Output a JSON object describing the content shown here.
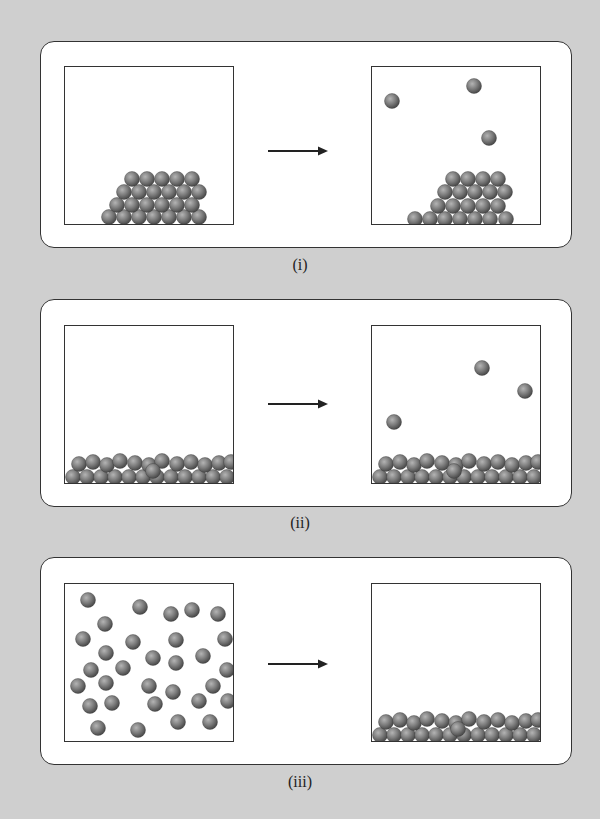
{
  "figure": {
    "ball_color": {
      "highlight": "#b4b4b4",
      "mid": "#7c7c7c",
      "edge": "#4a4a4a"
    },
    "background": "#cfcfcf",
    "ball_radius": 7.5,
    "panels": [
      {
        "label": "(i)",
        "description": "solid pile -> solid pile with 3 particles escaped into gas",
        "before": {
          "balls": [
            [
              44,
              150
            ],
            [
              59,
              150
            ],
            [
              74,
              150
            ],
            [
              89,
              150
            ],
            [
              104,
              150
            ],
            [
              119,
              150
            ],
            [
              134,
              150
            ],
            [
              52,
              138
            ],
            [
              67,
              138
            ],
            [
              82,
              138
            ],
            [
              97,
              138
            ],
            [
              112,
              138
            ],
            [
              127,
              138
            ],
            [
              59,
              125
            ],
            [
              74,
              125
            ],
            [
              89,
              125
            ],
            [
              104,
              125
            ],
            [
              119,
              125
            ],
            [
              134,
              125
            ],
            [
              67,
              112
            ],
            [
              82,
              112
            ],
            [
              97,
              112
            ],
            [
              112,
              112
            ],
            [
              127,
              112
            ]
          ]
        },
        "after": {
          "balls": [
            [
              43,
              152
            ],
            [
              58,
              152
            ],
            [
              73,
              152
            ],
            [
              88,
              152
            ],
            [
              103,
              152
            ],
            [
              118,
              152
            ],
            [
              134,
              152
            ],
            [
              66,
              139
            ],
            [
              81,
              139
            ],
            [
              96,
              139
            ],
            [
              111,
              139
            ],
            [
              126,
              139
            ],
            [
              73,
              125
            ],
            [
              88,
              125
            ],
            [
              103,
              125
            ],
            [
              118,
              125
            ],
            [
              133,
              125
            ],
            [
              81,
              112
            ],
            [
              96,
              112
            ],
            [
              111,
              112
            ],
            [
              126,
              112
            ],
            [
              20,
              34
            ],
            [
              102,
              19
            ],
            [
              117,
              71
            ]
          ]
        }
      },
      {
        "label": "(ii)",
        "description": "liquid layer -> liquid layer with 3 particles evaporated",
        "before": {
          "balls": [
            [
              8,
              151
            ],
            [
              22,
              151
            ],
            [
              36,
              151
            ],
            [
              50,
              151
            ],
            [
              64,
              151
            ],
            [
              78,
              151
            ],
            [
              92,
              151
            ],
            [
              106,
              151
            ],
            [
              120,
              151
            ],
            [
              134,
              151
            ],
            [
              148,
              151
            ],
            [
              162,
              151
            ],
            [
              14,
              138
            ],
            [
              28,
              136
            ],
            [
              42,
              139
            ],
            [
              55,
              135
            ],
            [
              70,
              137
            ],
            [
              84,
              139
            ],
            [
              97,
              135
            ],
            [
              112,
              138
            ],
            [
              126,
              136
            ],
            [
              140,
              139
            ],
            [
              154,
              137
            ],
            [
              166,
              136
            ],
            [
              88,
              145
            ]
          ]
        },
        "after": {
          "balls": [
            [
              8,
              151
            ],
            [
              22,
              151
            ],
            [
              36,
              151
            ],
            [
              50,
              151
            ],
            [
              64,
              151
            ],
            [
              78,
              151
            ],
            [
              92,
              151
            ],
            [
              106,
              151
            ],
            [
              120,
              151
            ],
            [
              134,
              151
            ],
            [
              148,
              151
            ],
            [
              162,
              151
            ],
            [
              14,
              138
            ],
            [
              28,
              136
            ],
            [
              42,
              139
            ],
            [
              55,
              135
            ],
            [
              70,
              137
            ],
            [
              84,
              139
            ],
            [
              97,
              135
            ],
            [
              112,
              138
            ],
            [
              126,
              136
            ],
            [
              140,
              139
            ],
            [
              154,
              137
            ],
            [
              166,
              136
            ],
            [
              82,
              145
            ],
            [
              22,
              96
            ],
            [
              110,
              42
            ],
            [
              153,
              65
            ]
          ]
        }
      },
      {
        "label": "(iii)",
        "description": "gas particles spread throughout -> condensed liquid layer",
        "before": {
          "balls": [
            [
              23,
              16
            ],
            [
              75,
              23
            ],
            [
              106,
              30
            ],
            [
              127,
              26
            ],
            [
              153,
              30
            ],
            [
              40,
              40
            ],
            [
              18,
              55
            ],
            [
              68,
              58
            ],
            [
              111,
              56
            ],
            [
              160,
              55
            ],
            [
              41,
              69
            ],
            [
              88,
              74
            ],
            [
              111,
              79
            ],
            [
              138,
              72
            ],
            [
              26,
              86
            ],
            [
              58,
              84
            ],
            [
              162,
              86
            ],
            [
              13,
              102
            ],
            [
              41,
              99
            ],
            [
              84,
              102
            ],
            [
              108,
              108
            ],
            [
              148,
              102
            ],
            [
              25,
              122
            ],
            [
              47,
              119
            ],
            [
              90,
              120
            ],
            [
              134,
              117
            ],
            [
              163,
              117
            ],
            [
              33,
              144
            ],
            [
              73,
              146
            ],
            [
              113,
              138
            ],
            [
              145,
              138
            ]
          ]
        },
        "after": {
          "balls": [
            [
              8,
              151
            ],
            [
              22,
              151
            ],
            [
              36,
              151
            ],
            [
              50,
              151
            ],
            [
              64,
              151
            ],
            [
              78,
              151
            ],
            [
              92,
              151
            ],
            [
              106,
              151
            ],
            [
              120,
              151
            ],
            [
              134,
              151
            ],
            [
              148,
              151
            ],
            [
              162,
              151
            ],
            [
              14,
              138
            ],
            [
              28,
              136
            ],
            [
              42,
              139
            ],
            [
              55,
              135
            ],
            [
              70,
              137
            ],
            [
              84,
              139
            ],
            [
              97,
              135
            ],
            [
              112,
              138
            ],
            [
              126,
              136
            ],
            [
              140,
              139
            ],
            [
              154,
              137
            ],
            [
              166,
              136
            ],
            [
              86,
              145
            ]
          ]
        }
      }
    ]
  }
}
